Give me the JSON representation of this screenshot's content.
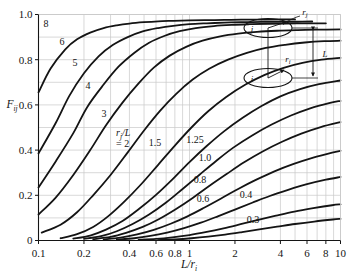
{
  "chart_data": {
    "type": "line",
    "title": "",
    "xlabel": "L/r_i",
    "ylabel": "F_ij",
    "xscale": "log",
    "xlim": [
      0.1,
      10
    ],
    "ylim": [
      0,
      1.0
    ],
    "grid": true,
    "legend_position": "inline-curve-labels",
    "parameter_label": "r_j /L",
    "parameter_label_eq": "= 2",
    "xticks": [
      "0.1",
      "0.2",
      "0.4",
      "0.6",
      "0.8",
      "1",
      "2",
      "4",
      "6",
      "8",
      "10"
    ],
    "xtick_values": [
      0.1,
      0.2,
      0.4,
      0.6,
      0.8,
      1,
      2,
      4,
      6,
      8,
      10
    ],
    "yticks": [
      "0",
      "0.2",
      "0.4",
      "0.6",
      "0.8",
      "1.0"
    ],
    "ytick_values": [
      0,
      0.2,
      0.4,
      0.6,
      0.8,
      1.0
    ],
    "series": [
      {
        "name": "8",
        "label": "8",
        "x": [
          0.1,
          0.12,
          0.15,
          0.18,
          0.22,
          0.27,
          0.33,
          0.4,
          0.5,
          0.62,
          0.78,
          1.0,
          1.3,
          1.7,
          2.2,
          3.0,
          4.0,
          5.0
        ],
        "y": [
          0.655,
          0.76,
          0.845,
          0.89,
          0.92,
          0.94,
          0.952,
          0.96,
          0.966,
          0.97,
          0.972,
          0.974,
          0.975,
          0.976,
          0.977,
          0.977,
          0.978,
          0.978
        ]
      },
      {
        "name": "6",
        "label": "6",
        "x": [
          0.1,
          0.13,
          0.16,
          0.2,
          0.25,
          0.31,
          0.39,
          0.49,
          0.62,
          0.78,
          1.0,
          1.3,
          1.7,
          2.2,
          3.0,
          4.0,
          5.2,
          6.5
        ],
        "y": [
          0.385,
          0.52,
          0.64,
          0.74,
          0.815,
          0.865,
          0.9,
          0.925,
          0.94,
          0.95,
          0.957,
          0.961,
          0.964,
          0.966,
          0.967,
          0.968,
          0.968,
          0.969
        ]
      },
      {
        "name": "5",
        "label": "5",
        "x": [
          0.1,
          0.13,
          0.17,
          0.21,
          0.27,
          0.34,
          0.43,
          0.54,
          0.68,
          0.86,
          1.1,
          1.45,
          1.9,
          2.5,
          3.3,
          4.4,
          6.0,
          8.0
        ],
        "y": [
          0.235,
          0.35,
          0.475,
          0.59,
          0.69,
          0.77,
          0.83,
          0.875,
          0.905,
          0.926,
          0.94,
          0.949,
          0.954,
          0.957,
          0.959,
          0.96,
          0.961,
          0.961
        ]
      },
      {
        "name": "4",
        "label": "4",
        "x": [
          0.1,
          0.13,
          0.17,
          0.22,
          0.28,
          0.36,
          0.46,
          0.58,
          0.74,
          0.95,
          1.22,
          1.6,
          2.1,
          2.8,
          3.8,
          5.2,
          7.0,
          10.0
        ],
        "y": [
          0.115,
          0.19,
          0.29,
          0.4,
          0.51,
          0.61,
          0.695,
          0.765,
          0.818,
          0.857,
          0.884,
          0.903,
          0.915,
          0.923,
          0.928,
          0.931,
          0.933,
          0.934
        ]
      },
      {
        "name": "3",
        "label": "3",
        "x": [
          0.105,
          0.14,
          0.18,
          0.23,
          0.3,
          0.39,
          0.5,
          0.64,
          0.82,
          1.05,
          1.35,
          1.8,
          2.4,
          3.2,
          4.3,
          5.8,
          7.8,
          10.0
        ],
        "y": [
          0.035,
          0.07,
          0.125,
          0.2,
          0.29,
          0.39,
          0.487,
          0.575,
          0.65,
          0.712,
          0.76,
          0.8,
          0.83,
          0.852,
          0.866,
          0.876,
          0.882,
          0.884
        ]
      },
      {
        "name": "2",
        "label": "= 2",
        "x": [
          0.14,
          0.18,
          0.23,
          0.29,
          0.37,
          0.48,
          0.62,
          0.8,
          1.03,
          1.33,
          1.75,
          2.35,
          3.15,
          4.2,
          5.6,
          7.5,
          10.0
        ],
        "y": [
          0.01,
          0.028,
          0.06,
          0.108,
          0.172,
          0.25,
          0.335,
          0.42,
          0.5,
          0.572,
          0.635,
          0.69,
          0.733,
          0.764,
          0.786,
          0.8,
          0.808
        ]
      },
      {
        "name": "1.5",
        "label": "1.5",
        "x": [
          0.17,
          0.22,
          0.28,
          0.36,
          0.46,
          0.6,
          0.78,
          1.0,
          1.3,
          1.7,
          2.25,
          3.0,
          4.0,
          5.4,
          7.2,
          10.0
        ],
        "y": [
          0.008,
          0.022,
          0.048,
          0.086,
          0.138,
          0.202,
          0.274,
          0.347,
          0.418,
          0.484,
          0.543,
          0.595,
          0.638,
          0.67,
          0.692,
          0.708
        ]
      },
      {
        "name": "1.25",
        "label": "1.25",
        "x": [
          0.2,
          0.26,
          0.33,
          0.42,
          0.54,
          0.7,
          0.9,
          1.16,
          1.5,
          1.95,
          2.6,
          3.5,
          4.7,
          6.3,
          8.4,
          10.0
        ],
        "y": [
          0.007,
          0.019,
          0.041,
          0.073,
          0.115,
          0.168,
          0.228,
          0.29,
          0.352,
          0.411,
          0.465,
          0.513,
          0.553,
          0.585,
          0.608,
          0.618
        ]
      },
      {
        "name": "1.0",
        "label": "1.0",
        "x": [
          0.23,
          0.3,
          0.38,
          0.49,
          0.63,
          0.81,
          1.05,
          1.35,
          1.76,
          2.3,
          3.05,
          4.1,
          5.5,
          7.4,
          10.0
        ],
        "y": [
          0.006,
          0.016,
          0.034,
          0.06,
          0.095,
          0.138,
          0.188,
          0.241,
          0.294,
          0.346,
          0.394,
          0.437,
          0.473,
          0.502,
          0.524
        ]
      },
      {
        "name": "0.8",
        "label": "0.8",
        "x": [
          0.27,
          0.35,
          0.45,
          0.58,
          0.75,
          0.97,
          1.25,
          1.62,
          2.1,
          2.75,
          3.65,
          4.9,
          6.6,
          8.8,
          10.0
        ],
        "y": [
          0.005,
          0.013,
          0.027,
          0.047,
          0.074,
          0.107,
          0.145,
          0.186,
          0.228,
          0.268,
          0.306,
          0.339,
          0.367,
          0.389,
          0.397
        ]
      },
      {
        "name": "0.6",
        "label": "0.6",
        "x": [
          0.33,
          0.43,
          0.55,
          0.71,
          0.92,
          1.19,
          1.54,
          2.0,
          2.6,
          3.4,
          4.5,
          6.0,
          8.0,
          10.0
        ],
        "y": [
          0.004,
          0.01,
          0.02,
          0.035,
          0.055,
          0.079,
          0.107,
          0.137,
          0.167,
          0.197,
          0.224,
          0.249,
          0.269,
          0.281
        ]
      },
      {
        "name": "0.4",
        "label": "0.4",
        "x": [
          0.46,
          0.6,
          0.77,
          1.0,
          1.3,
          1.68,
          2.18,
          2.85,
          3.75,
          4.95,
          6.6,
          8.8,
          10.0
        ],
        "y": [
          0.003,
          0.007,
          0.014,
          0.024,
          0.038,
          0.054,
          0.072,
          0.091,
          0.11,
          0.128,
          0.143,
          0.156,
          0.16
        ]
      },
      {
        "name": "0.3",
        "label": "0.3",
        "x": [
          0.62,
          0.8,
          1.03,
          1.33,
          1.72,
          2.23,
          2.9,
          3.8,
          5.0,
          6.7,
          8.9,
          10.0
        ],
        "y": [
          0.002,
          0.005,
          0.01,
          0.017,
          0.026,
          0.037,
          0.049,
          0.061,
          0.073,
          0.084,
          0.093,
          0.096
        ]
      }
    ]
  },
  "inset": {
    "label_j": "j",
    "label_i": "i",
    "label_rj": "r",
    "label_rj_sub": "j",
    "label_ri": "r",
    "label_ri_sub": "i",
    "label_L": "L"
  },
  "axis": {
    "ylabel_main": "F",
    "ylabel_sub": "ij",
    "xlabel_main": "L/r",
    "xlabel_sub": "i",
    "param_main": "r",
    "param_sub": "j",
    "param_rest": "/L",
    "param_eq": "= 2"
  },
  "colors": {
    "curve": "#141414",
    "grid": "#c9c9c9",
    "axis": "#141414",
    "background": "#ffffff"
  }
}
